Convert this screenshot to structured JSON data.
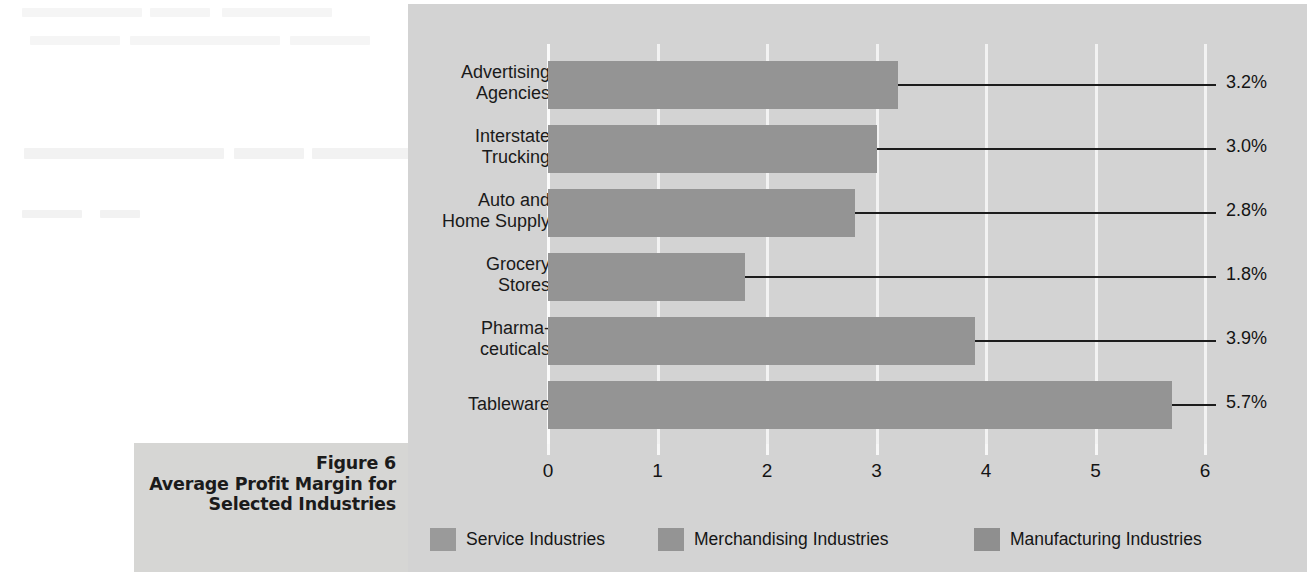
{
  "caption": {
    "figure_number": "Figure 6",
    "title_line1": "Average Profit Margin for",
    "title_line2": "Selected Industries"
  },
  "colors": {
    "panel_background": "#d3d3d3",
    "caption_background": "#d6d6d4",
    "bar_fill": "#949494",
    "gridline": "#f2f2f2",
    "leader_line": "#1c1c1c",
    "text": "#141414"
  },
  "legend": {
    "position": "bottom-left",
    "items": [
      {
        "label": "Service Industries",
        "color": "#9a9a9a"
      },
      {
        "label": "Merchandising Industries",
        "color": "#949494"
      },
      {
        "label": "Manufacturing Industries",
        "color": "#8f8f8f"
      }
    ]
  },
  "chart_data": {
    "type": "bar",
    "orientation": "horizontal",
    "title": "Average Profit Margin for Selected Industries",
    "subtitle": "Figure 6",
    "xlabel": "",
    "ylabel": "",
    "xlim": [
      0,
      6
    ],
    "xticks": [
      0,
      1,
      2,
      3,
      4,
      5,
      6
    ],
    "xtick_labels": [
      "0",
      "1",
      "2",
      "3",
      "4",
      "5",
      "6"
    ],
    "grid": true,
    "grid_axis": "x",
    "categories": [
      "Advertising Agencies",
      "Interstate Trucking",
      "Auto and Home Supply",
      "Grocery Stores",
      "Pharmaceuticals",
      "Tableware"
    ],
    "category_label_lines": [
      [
        "Advertising",
        "Agencies"
      ],
      [
        "Interstate",
        "Trucking"
      ],
      [
        "Auto and",
        "Home Supply"
      ],
      [
        "Grocery",
        "Stores"
      ],
      [
        "Pharma-",
        "ceuticals"
      ],
      [
        "Tableware"
      ]
    ],
    "values": [
      3.2,
      3.0,
      2.8,
      1.8,
      3.9,
      5.7
    ],
    "data_labels": [
      "3.2%",
      "3.0%",
      "2.8%",
      "1.8%",
      "3.9%",
      "5.7%"
    ],
    "group": [
      "Service Industries",
      "Service Industries",
      "Merchandising Industries",
      "Merchandising Industries",
      "Manufacturing Industries",
      "Manufacturing Industries"
    ],
    "series": [
      {
        "name": "Average Profit Margin (%)",
        "values": [
          3.2,
          3.0,
          2.8,
          1.8,
          3.9,
          5.7
        ]
      }
    ]
  }
}
